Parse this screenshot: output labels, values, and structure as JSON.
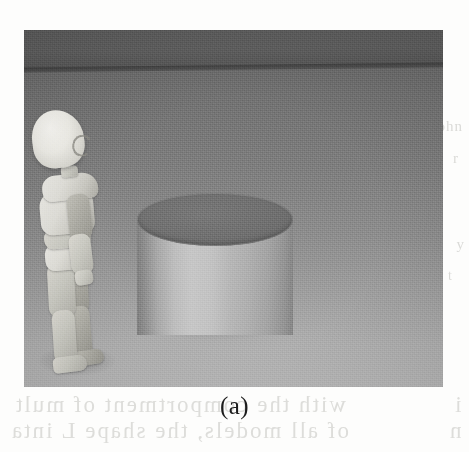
{
  "figure": {
    "caption": "(a)",
    "kind": "rendered-3d-scene",
    "objects": [
      {
        "name": "mannequin",
        "label": "articulated humanoid figure"
      },
      {
        "name": "cylinder",
        "label": "upright circular cylinder"
      },
      {
        "name": "floor",
        "label": "graded grey ground plane"
      },
      {
        "name": "backwall",
        "label": "dark backdrop band above horizon"
      }
    ],
    "colors": {
      "background_top": "#6d6d6d",
      "background_bottom": "#b6b6b6",
      "backwall": "#5c5c5c",
      "cylinder_top": "#6f6f6f",
      "cylinder_body_highlight": "#c6c6c6",
      "cylinder_body_shadow": "#7f7f7f",
      "mannequin_light": "#f1f0ea",
      "mannequin_mid": "#ccccc4",
      "mannequin_dark": "#97968f",
      "page": "#fdfdfc",
      "caption_text": "#1c1c1c",
      "bleed_text": "#d9d9d6"
    }
  },
  "bleedthrough": {
    "note": "faint show-through text from the reverse side of the scanned page",
    "lines": {
      "top_right": "ohn",
      "mid_right": "r",
      "right_low": "y",
      "right_low2": "t",
      "left_col": " ",
      "caption_left_1": "with the comportment of mult",
      "caption_left_2": "of all models, the shape L inta",
      "caption_right_1": "i",
      "caption_right_2": "n"
    }
  }
}
